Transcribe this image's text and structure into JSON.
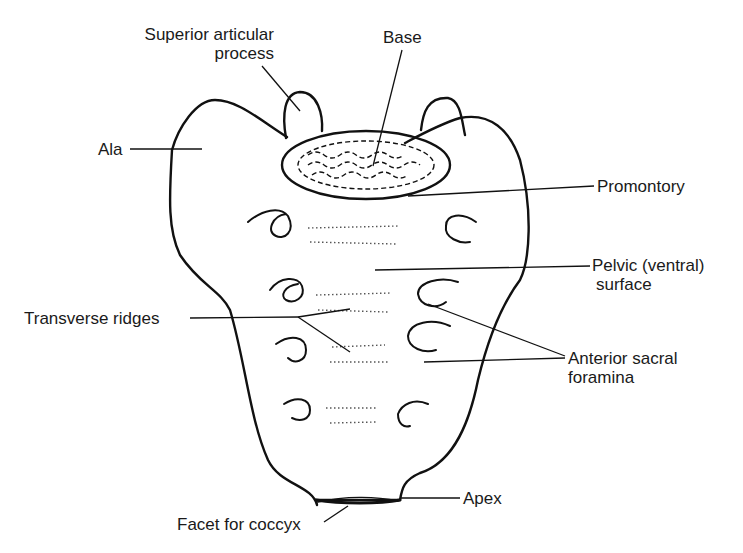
{
  "diagram": {
    "stroke_color": "#111111",
    "label_color": "#1a1a1a",
    "labels": {
      "superior_articular_process_line1": "Superior articular",
      "superior_articular_process_line2": "process",
      "base": "Base",
      "ala": "Ala",
      "promontory": "Promontory",
      "pelvic_surface_line1": "Pelvic (ventral)",
      "pelvic_surface_line2": "surface",
      "transverse_ridges": "Transverse ridges",
      "anterior_sacral_foramina_line1": "Anterior sacral",
      "anterior_sacral_foramina_line2": "foramina",
      "apex": "Apex",
      "facet_for_coccyx": "Facet for coccyx"
    }
  }
}
